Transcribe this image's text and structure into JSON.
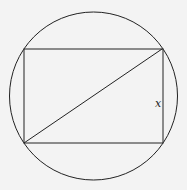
{
  "diagram": {
    "circle": {
      "cx": 93.5,
      "cy": 96,
      "r": 84
    },
    "rectangle": {
      "x": 24,
      "y": 49,
      "width": 139,
      "height": 94
    },
    "diagonal": {
      "x1": 24,
      "y1": 143,
      "x2": 162,
      "y2": 49
    },
    "side_label": "x",
    "colors": {
      "stroke": "#222222",
      "background": "#f3f3f3"
    }
  }
}
